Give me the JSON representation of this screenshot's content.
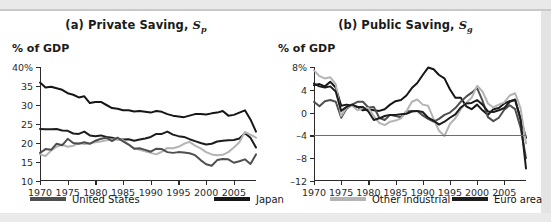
{
  "figure": {
    "unit_label_a": "% of GDP",
    "unit_label_b": "% of GDP"
  },
  "panel_a": {
    "title_prefix": "(a) Private Saving, ",
    "title_symbol": "S",
    "title_subscript": "p"
  },
  "panel_b": {
    "title_prefix": "(b) Public Saving, ",
    "title_symbol": "S",
    "title_subscript": "g"
  },
  "legend": {
    "items": [
      {
        "label": "United States",
        "color": "#4f4f4f"
      },
      {
        "label": "Japan",
        "color": "#161616"
      },
      {
        "label": "Other industrial",
        "color": "#b4b4b4"
      },
      {
        "label": "Euro area",
        "color": "#1d1d1d"
      }
    ]
  },
  "chart_data": [
    {
      "type": "line",
      "title": "(a) Private Saving, Sp",
      "xlabel": "",
      "ylabel": "% of GDP",
      "xlim": [
        1970,
        2009
      ],
      "ylim": [
        10,
        40
      ],
      "yticks": [
        10,
        15,
        20,
        25,
        30,
        35,
        40
      ],
      "ytick_labels": [
        "10",
        "15",
        "20",
        "25",
        "30",
        "35",
        "40%"
      ],
      "xticks": [
        1970,
        1975,
        1980,
        1985,
        1990,
        1995,
        2000,
        2005
      ],
      "xtick_labels": [
        "1970",
        "1975",
        "1980",
        "1985",
        "1990",
        "1995",
        "2000",
        "2005"
      ],
      "grid": false,
      "legend_position": "below-figure",
      "x": [
        1970,
        1971,
        1972,
        1973,
        1974,
        1975,
        1976,
        1977,
        1978,
        1979,
        1980,
        1981,
        1982,
        1983,
        1984,
        1985,
        1986,
        1987,
        1988,
        1989,
        1990,
        1991,
        1992,
        1993,
        1994,
        1995,
        1996,
        1997,
        1998,
        1999,
        2000,
        2001,
        2002,
        2003,
        2004,
        2005,
        2006,
        2007,
        2008,
        2009
      ],
      "series": [
        {
          "name": "Japan",
          "color": "#161616",
          "values": [
            35.9,
            34.6,
            34.8,
            34.4,
            34.0,
            33.1,
            32.7,
            32.0,
            32.3,
            30.5,
            30.8,
            30.8,
            30.0,
            29.2,
            29.0,
            28.6,
            28.6,
            28.3,
            28.4,
            28.2,
            28.0,
            28.4,
            28.2,
            27.6,
            27.2,
            27.0,
            26.8,
            27.2,
            27.6,
            27.6,
            27.5,
            27.8,
            28.0,
            28.4,
            27.2,
            27.4,
            28.0,
            28.6,
            26.2,
            23.0
          ]
        },
        {
          "name": "Euro area",
          "color": "#1d1d1d",
          "values": [
            23.7,
            23.6,
            23.6,
            23.7,
            23.3,
            23.2,
            22.5,
            22.4,
            23.0,
            22.0,
            21.8,
            22.0,
            21.6,
            21.4,
            21.0,
            20.9,
            21.0,
            20.6,
            20.9,
            21.2,
            21.6,
            22.4,
            22.4,
            23.0,
            22.2,
            21.8,
            21.6,
            21.0,
            20.5,
            20.0,
            19.6,
            19.8,
            20.4,
            20.6,
            20.7,
            20.8,
            21.2,
            22.6,
            21.4,
            18.8
          ]
        },
        {
          "name": "Other industrial",
          "color": "#b4b4b4",
          "values": [
            17.0,
            16.6,
            18.0,
            19.0,
            19.6,
            19.0,
            19.3,
            20.0,
            19.7,
            19.9,
            20.2,
            20.4,
            20.7,
            20.9,
            21.0,
            20.7,
            19.6,
            18.6,
            18.2,
            17.8,
            17.4,
            17.0,
            17.7,
            18.7,
            18.6,
            19.0,
            19.8,
            20.3,
            19.3,
            18.6,
            17.6,
            17.0,
            16.8,
            16.9,
            17.6,
            18.8,
            20.2,
            22.9,
            22.2,
            21.4
          ]
        },
        {
          "name": "United States",
          "color": "#4f4f4f",
          "values": [
            17.4,
            18.4,
            18.2,
            19.8,
            19.4,
            21.1,
            20.0,
            19.8,
            20.2,
            19.8,
            20.6,
            21.1,
            21.4,
            20.5,
            21.4,
            20.4,
            19.6,
            18.5,
            18.6,
            18.2,
            17.7,
            18.5,
            18.4,
            17.6,
            17.4,
            17.6,
            17.5,
            17.3,
            16.8,
            15.5,
            14.4,
            14.0,
            15.5,
            15.8,
            15.7,
            14.8,
            15.2,
            15.7,
            14.5,
            17.0
          ]
        }
      ]
    },
    {
      "type": "line",
      "title": "(b) Public Saving, Sg",
      "xlabel": "",
      "ylabel": "% of GDP",
      "xlim": [
        1970,
        2009
      ],
      "ylim": [
        -12,
        8
      ],
      "yticks": [
        -12,
        -8,
        -4,
        0,
        4,
        8
      ],
      "ytick_labels": [
        "–12",
        "–8",
        "–4",
        "0",
        "4",
        "8%"
      ],
      "xticks": [
        1970,
        1975,
        1980,
        1985,
        1990,
        1995,
        2000,
        2005
      ],
      "xtick_labels": [
        "1970",
        "1975",
        "1980",
        "1985",
        "1990",
        "1995",
        "2000",
        "2005"
      ],
      "grid": false,
      "reference_line_y": -4,
      "legend_position": "below-figure",
      "x": [
        1970,
        1971,
        1972,
        1973,
        1974,
        1975,
        1976,
        1977,
        1978,
        1979,
        1980,
        1981,
        1982,
        1983,
        1984,
        1985,
        1986,
        1987,
        1988,
        1989,
        1990,
        1991,
        1992,
        1993,
        1994,
        1995,
        1996,
        1997,
        1998,
        1999,
        2000,
        2001,
        2002,
        2003,
        2004,
        2005,
        2006,
        2007,
        2008,
        2009
      ],
      "series": [
        {
          "name": "Japan",
          "color": "#161616",
          "values": [
            4.8,
            5.0,
            4.6,
            5.4,
            4.4,
            1.2,
            1.4,
            1.2,
            1.0,
            0.4,
            0.6,
            0.4,
            0.3,
            0.6,
            1.4,
            2.0,
            2.2,
            3.0,
            4.3,
            5.2,
            6.6,
            7.9,
            7.6,
            6.6,
            6.0,
            4.1,
            2.6,
            2.6,
            1.1,
            0.6,
            1.4,
            0.4,
            -0.4,
            0.6,
            0.8,
            1.6,
            2.0,
            2.2,
            -1.0,
            -4.4
          ]
        },
        {
          "name": "United States",
          "color": "#4f4f4f",
          "values": [
            1.9,
            1.1,
            2.0,
            2.2,
            1.9,
            -0.9,
            0.7,
            1.4,
            1.9,
            1.9,
            0.9,
            1.0,
            -0.9,
            -1.3,
            -0.4,
            -0.6,
            -0.8,
            0.2,
            0.3,
            0.3,
            -0.5,
            -1.1,
            -1.6,
            -1.1,
            -0.4,
            0.0,
            0.8,
            1.9,
            2.8,
            3.5,
            4.3,
            2.1,
            -0.8,
            -1.5,
            -0.9,
            0.5,
            1.3,
            0.6,
            -2.6,
            -8.0
          ]
        },
        {
          "name": "Other industrial",
          "color": "#b4b4b4",
          "values": [
            7.4,
            6.4,
            6.0,
            6.2,
            5.0,
            -0.6,
            0.9,
            1.2,
            0.4,
            0.8,
            0.8,
            -0.6,
            -1.8,
            -2.2,
            -1.6,
            -1.4,
            -1.0,
            0.2,
            1.9,
            2.3,
            1.4,
            1.2,
            -1.1,
            -3.2,
            -4.1,
            -2.0,
            -1.0,
            0.6,
            1.7,
            2.6,
            4.7,
            3.7,
            1.6,
            0.9,
            1.4,
            1.8,
            3.0,
            3.4,
            0.8,
            -5.4
          ]
        },
        {
          "name": "Euro area",
          "color": "#1d1d1d",
          "values": [
            5.1,
            4.6,
            4.4,
            4.6,
            3.7,
            0.3,
            1.0,
            1.4,
            1.0,
            1.0,
            0.2,
            -1.3,
            -1.0,
            -0.6,
            -0.4,
            -0.4,
            -0.3,
            -0.2,
            0.2,
            0.3,
            0.1,
            -0.9,
            -1.4,
            -2.1,
            -1.6,
            -0.9,
            -0.3,
            0.9,
            1.6,
            1.7,
            2.2,
            1.4,
            0.2,
            0.1,
            0.4,
            0.8,
            1.9,
            2.3,
            -1.3,
            -9.8
          ]
        }
      ]
    }
  ]
}
